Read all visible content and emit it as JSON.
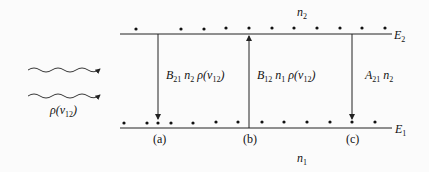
{
  "diagram": {
    "upper_level": {
      "label": "E",
      "sub": "2",
      "population_label": "n",
      "population_sub": "2"
    },
    "lower_level": {
      "label": "E",
      "sub": "1",
      "population_label": "n",
      "population_sub": "1"
    },
    "radiation_label": "ρ(ν12)",
    "transitions": [
      {
        "id": "a",
        "caption": "(a)",
        "rate": "B21 n2 ρ(ν12)",
        "direction": "down",
        "name": "stimulated emission"
      },
      {
        "id": "b",
        "caption": "(b)",
        "rate": "B12 n1 ρ(ν12)",
        "direction": "up",
        "name": "absorption"
      },
      {
        "id": "c",
        "caption": "(c)",
        "rate": "A21 n2",
        "direction": "down",
        "name": "spontaneous emission"
      }
    ],
    "colors": {
      "line": "#222222",
      "background": "#fbfbfb"
    }
  }
}
